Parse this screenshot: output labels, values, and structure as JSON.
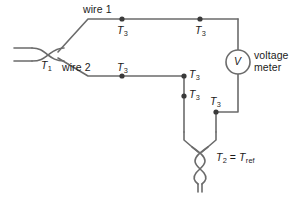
{
  "figure": {
    "line_color": "#6b6b6b",
    "node_color": "#3a3a3a",
    "text_color": "#1b1b1b",
    "background": "#ffffff"
  },
  "labels": {
    "t1": "T",
    "t1_sub": "1",
    "wire1": "wire 1",
    "wire2": "wire 2",
    "t3": "T",
    "t3_sub": "3",
    "meter_symbol": "V",
    "meter_name": "voltage meter",
    "t2_equation_lead": "T",
    "t2_equation_lead_sub": "2",
    "t2_equation_eq": " = ",
    "t2_equation_right": "T",
    "t2_equation_right_sub": "ref"
  },
  "nodes": [
    {
      "name": "t3-wire1-left",
      "x": 122,
      "y": 19,
      "label": "T3"
    },
    {
      "name": "t3-wire1-right",
      "x": 200,
      "y": 19,
      "label": "T3"
    },
    {
      "name": "t3-wire2-left",
      "x": 122,
      "y": 76,
      "label": "T3"
    },
    {
      "name": "t3-wire2-corner",
      "x": 184,
      "y": 76,
      "label": "T3"
    },
    {
      "name": "t3-wire2-lower",
      "x": 184,
      "y": 96,
      "label": "T3"
    },
    {
      "name": "t3-meter-return",
      "x": 216,
      "y": 112,
      "label": "T3"
    }
  ],
  "junctions": [
    {
      "name": "t1-hot-junction",
      "label": "T1",
      "x": 45,
      "y": 57
    },
    {
      "name": "t2-reference-junction",
      "label": "T2 = Tref",
      "x": 198,
      "y": 158
    }
  ],
  "meter": {
    "name": "voltage-meter",
    "symbol": "V",
    "center_x": 238,
    "center_y": 62,
    "radius": 12
  }
}
